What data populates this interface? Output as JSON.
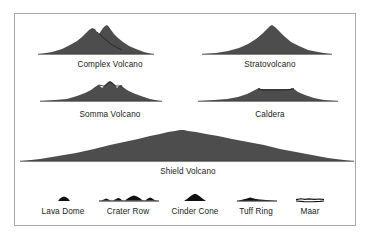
{
  "figure": {
    "background_color": "#ffffff",
    "frame_color": "#a8a8a8",
    "silhouette_color": "#4d4d4d",
    "small_silhouette_color": "#111111",
    "label_color": "#1a1a1a"
  },
  "major_volcanoes": [
    {
      "id": "complex-volcano",
      "label": "Complex Volcano",
      "row": 1,
      "column": "left",
      "label_x": 110,
      "label_y": 67,
      "description": "Twin-peaked broad cone with overlapping summit domes"
    },
    {
      "id": "stratovolcano",
      "label": "Stratovolcano",
      "row": 1,
      "column": "right",
      "label_x": 270,
      "label_y": 67,
      "description": "Single steep symmetrical cone with concave flanks"
    },
    {
      "id": "somma-volcano",
      "label": "Somma Volcano",
      "row": 2,
      "column": "left",
      "label_x": 110,
      "label_y": 117,
      "description": "Low broad cone with a central cone nested inside a remnant rim"
    },
    {
      "id": "caldera",
      "label": "Caldera",
      "row": 2,
      "column": "right",
      "label_x": 270,
      "label_y": 117,
      "description": "Very low wide profile with a flat collapsed summit depression"
    },
    {
      "id": "shield-volcano",
      "label": "Shield Volcano",
      "row": 3,
      "column": "full",
      "label_x": 188,
      "label_y": 174,
      "description": "Extremely broad gently sloping dome spanning the full width"
    }
  ],
  "minor_volcanoes": [
    {
      "id": "lava-dome",
      "label": "Lava Dome",
      "label_x": 63,
      "label_y": 214,
      "description": "Tiny steep-sided rounded mound"
    },
    {
      "id": "crater-row",
      "label": "Crater Row",
      "label_x": 128,
      "label_y": 214,
      "description": "Line of several small adjacent cones along a fissure"
    },
    {
      "id": "cinder-cone",
      "label": "Cinder Cone",
      "label_x": 195,
      "label_y": 214,
      "description": "Small steep conical pile of cinders"
    },
    {
      "id": "tuff-ring",
      "label": "Tuff Ring",
      "label_x": 256,
      "label_y": 214,
      "description": "Low wide rim with a shallow central depression"
    },
    {
      "id": "maar",
      "label": "Maar",
      "label_x": 310,
      "label_y": 214,
      "description": "Nearly flat broad crater set below ground level"
    }
  ]
}
